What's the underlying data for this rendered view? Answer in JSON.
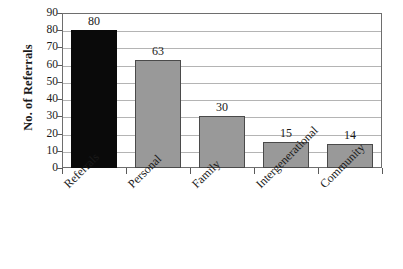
{
  "chart_data": {
    "type": "bar",
    "title": "",
    "subtitle": "",
    "xlabel": "",
    "ylabel": "No. of Referrals",
    "categories": [
      "Referrals",
      "Personal",
      "Family",
      "Intergenerational",
      "Community"
    ],
    "values": [
      80,
      63,
      30,
      15,
      14
    ],
    "data_labels": [
      "80",
      "63",
      "30",
      "15",
      "14"
    ],
    "ylim": [
      0,
      90
    ],
    "ytick_labels": [
      "0",
      "10",
      "20",
      "30",
      "40",
      "50",
      "60",
      "70",
      "80",
      "90"
    ],
    "ytick_values": [
      0,
      10,
      20,
      30,
      40,
      50,
      60,
      70,
      80,
      90
    ],
    "grid": "horizontal",
    "legend": "none",
    "bar_colors": [
      "#0a0a0a",
      "#999999",
      "#999999",
      "#999999",
      "#999999"
    ],
    "bar_border_colors": [
      "#0a0a0a",
      "#4a4a4a",
      "#4a4a4a",
      "#4a4a4a",
      "#4a4a4a"
    ],
    "plot_border_color": "#6e6e6e",
    "gridline_color": "#b4b4b4",
    "background_color": "#ffffff"
  }
}
